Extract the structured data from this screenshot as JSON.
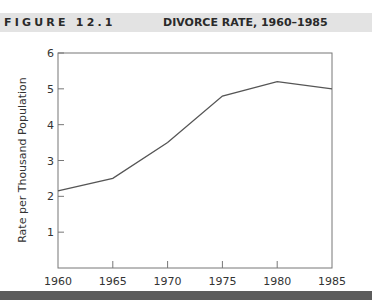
{
  "figure": {
    "label": "FIGURE 12.1",
    "title": "DIVORCE RATE, 1960–1985"
  },
  "colors": {
    "title_band": "#e3e3e3",
    "bottom_bar": "#5c5c5c",
    "line": "#555555",
    "axis": "#777777"
  },
  "chart_data": {
    "type": "line",
    "title": "DIVORCE RATE, 1960–1985",
    "xlabel": "",
    "ylabel": "Rate per Thousand Population",
    "x": [
      1960,
      1965,
      1970,
      1975,
      1980,
      1985
    ],
    "categories": [
      "1960",
      "1965",
      "1970",
      "1975",
      "1980",
      "1985"
    ],
    "series": [
      {
        "name": "Divorce rate",
        "values": [
          2.15,
          2.5,
          3.5,
          4.8,
          5.2,
          5.0
        ]
      }
    ],
    "yticks": [
      1,
      2,
      3,
      4,
      5,
      6
    ],
    "ytick_labels": [
      "1",
      "2",
      "3",
      "4",
      "5",
      "6"
    ],
    "ylim": [
      0,
      6
    ],
    "xlim": [
      1960,
      1985
    ],
    "grid": false,
    "legend": "none"
  }
}
